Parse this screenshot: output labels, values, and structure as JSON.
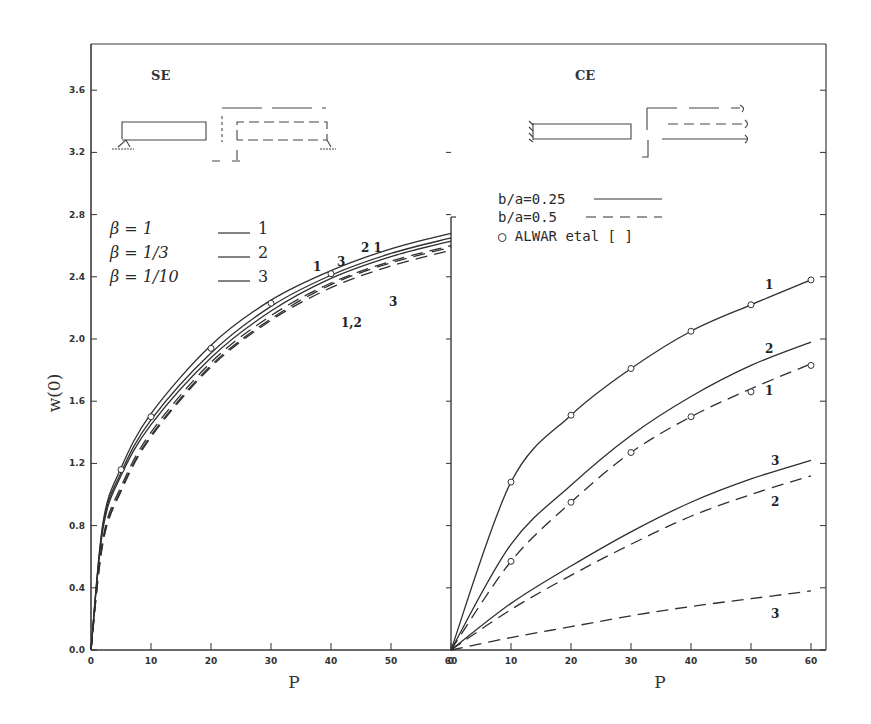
{
  "figure": {
    "ylabel": "w(0)",
    "xlabel_left": "P",
    "xlabel_right": "P",
    "y_ticks": [
      "0.0",
      "0.4",
      "0.8",
      "1.2",
      "1.6",
      "2.0",
      "2.4",
      "2.8",
      "3.2",
      "3.6"
    ],
    "x_ticks": [
      "0",
      "10",
      "20",
      "30",
      "40",
      "50",
      "60"
    ],
    "left_panel": {
      "title": "SE",
      "legend": [
        {
          "symbol": "β = 1",
          "line_label": "1"
        },
        {
          "symbol": "β = 1/3",
          "line_label": "2"
        },
        {
          "symbol": "β = 1/10",
          "line_label": "3"
        }
      ],
      "curve_labels": [
        "1",
        "3",
        "2 1",
        "3",
        "1,2"
      ]
    },
    "right_panel": {
      "title": "CE",
      "legend": [
        {
          "text": "b/a=0.25",
          "style": "solid"
        },
        {
          "text": "b/a=0.5",
          "style": "dashed"
        },
        {
          "text": "○ ALWAR etal [    ]",
          "style": "marker"
        }
      ],
      "curve_labels": [
        "1",
        "2",
        "1",
        "3",
        "2",
        "3"
      ]
    },
    "colors": {
      "ink": "#2a2a2a",
      "background": "#ffffff"
    }
  },
  "chart_data": [
    {
      "type": "line",
      "title": "SE",
      "xlabel": "P",
      "ylabel": "w(0)",
      "xlim": [
        0,
        60
      ],
      "ylim": [
        0,
        3.8
      ],
      "grid": false,
      "x": [
        0,
        2,
        5,
        10,
        20,
        30,
        40,
        50,
        60
      ],
      "series": [
        {
          "name": "b/a=0.25, β=1",
          "style": "solid",
          "values": [
            0,
            0.82,
            1.17,
            1.52,
            1.96,
            2.25,
            2.44,
            2.58,
            2.68
          ]
        },
        {
          "name": "b/a=0.25, β=1/3",
          "style": "solid",
          "values": [
            0,
            0.8,
            1.14,
            1.48,
            1.91,
            2.21,
            2.41,
            2.55,
            2.65
          ]
        },
        {
          "name": "b/a=0.25, β=1/10",
          "style": "solid",
          "values": [
            0,
            0.78,
            1.12,
            1.45,
            1.88,
            2.18,
            2.39,
            2.53,
            2.63
          ]
        },
        {
          "name": "b/a=0.5, β=1",
          "style": "dashed",
          "values": [
            0,
            0.72,
            1.05,
            1.4,
            1.85,
            2.15,
            2.36,
            2.5,
            2.6
          ]
        },
        {
          "name": "b/a=0.5, β=1/3",
          "style": "dashed",
          "values": [
            0,
            0.7,
            1.03,
            1.38,
            1.83,
            2.13,
            2.35,
            2.49,
            2.59
          ]
        },
        {
          "name": "b/a=0.5, β=1/10",
          "style": "dashed",
          "values": [
            0,
            0.69,
            1.02,
            1.37,
            1.82,
            2.12,
            2.33,
            2.47,
            2.57
          ]
        }
      ],
      "markers": {
        "name": "ALWAR etal",
        "x": [
          5,
          10,
          20,
          30,
          40
        ],
        "values": [
          1.16,
          1.5,
          1.94,
          2.23,
          2.42
        ]
      },
      "legend": [
        "β = 1 — 1",
        "β = 1/3 — 2",
        "β = 1/10 — 3"
      ]
    },
    {
      "type": "line",
      "title": "CE",
      "xlabel": "P",
      "ylabel": "w(0)",
      "xlim": [
        0,
        60
      ],
      "ylim": [
        0,
        3.8
      ],
      "grid": false,
      "x": [
        0,
        10,
        20,
        30,
        40,
        50,
        60
      ],
      "series": [
        {
          "name": "b/a=0.25, β=1",
          "style": "solid",
          "values": [
            0,
            1.08,
            1.51,
            1.81,
            2.05,
            2.22,
            2.38
          ]
        },
        {
          "name": "b/a=0.25, β=1/3",
          "style": "solid",
          "values": [
            0,
            0.68,
            1.06,
            1.38,
            1.63,
            1.83,
            1.98
          ]
        },
        {
          "name": "b/a=0.25, β=1/10",
          "style": "solid",
          "values": [
            0,
            0.3,
            0.54,
            0.76,
            0.95,
            1.1,
            1.22
          ]
        },
        {
          "name": "b/a=0.5, β=1",
          "style": "dashed",
          "values": [
            0,
            0.57,
            0.95,
            1.27,
            1.5,
            1.68,
            1.84
          ]
        },
        {
          "name": "b/a=0.5, β=1/3",
          "style": "dashed",
          "values": [
            0,
            0.26,
            0.48,
            0.68,
            0.86,
            1.0,
            1.12
          ]
        },
        {
          "name": "b/a=0.5, β=1/10",
          "style": "dashed",
          "values": [
            0,
            0.08,
            0.15,
            0.22,
            0.28,
            0.33,
            0.38
          ]
        }
      ],
      "markers": {
        "name": "ALWAR etal",
        "points": [
          [
            10,
            1.08
          ],
          [
            20,
            1.51
          ],
          [
            30,
            1.81
          ],
          [
            40,
            2.05
          ],
          [
            50,
            2.22
          ],
          [
            60,
            2.38
          ],
          [
            10,
            0.57
          ],
          [
            20,
            0.95
          ],
          [
            30,
            1.27
          ],
          [
            40,
            1.5
          ],
          [
            50,
            1.66
          ],
          [
            60,
            1.83
          ]
        ]
      },
      "legend": [
        "b/a=0.25 (solid)",
        "b/a=0.5 (dashed)",
        "○ ALWAR etal [ ]"
      ]
    }
  ]
}
